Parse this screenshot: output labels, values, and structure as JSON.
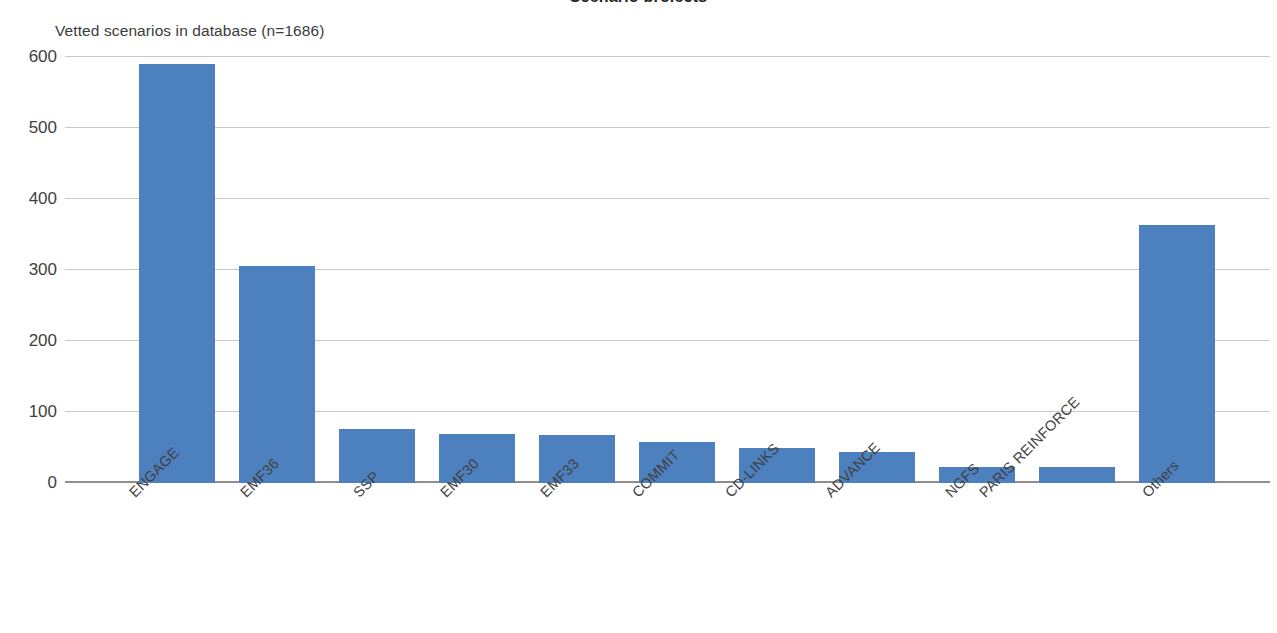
{
  "figure": {
    "clipped_title": "Scenario projects",
    "subtitle": "Vetted scenarios in database (n=1686)"
  },
  "chart_data": {
    "type": "bar",
    "title": "Vetted scenarios in database (n=1686)",
    "xlabel": "",
    "ylabel": "",
    "ylim": [
      0,
      600
    ],
    "yticks": [
      0,
      100,
      200,
      300,
      400,
      500,
      600
    ],
    "ytick_labels": [
      "0",
      "100",
      "200",
      "300",
      "400",
      "500",
      "600"
    ],
    "grid": true,
    "legend": "none",
    "bar_color": "#4d80bf",
    "total_n": 1686,
    "categories": [
      "ENGAGE",
      "EMF36",
      "SSP",
      "EMF30",
      "EMF33",
      "COMMIT",
      "CD-LINKS",
      "ADVANCE",
      "NGFS",
      "PARIS REINFORCE",
      "Others"
    ],
    "values": [
      590,
      305,
      76,
      69,
      68,
      58,
      50,
      44,
      23,
      22,
      363
    ]
  }
}
